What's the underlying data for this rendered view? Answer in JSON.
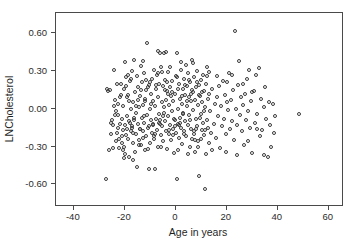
{
  "chart_data": {
    "type": "scatter",
    "title": "",
    "xlabel": "Age in years",
    "ylabel": "LNCholesterol",
    "xlim": [
      -47,
      66
    ],
    "ylim": [
      -0.78,
      0.76
    ],
    "grid": false,
    "legend": null,
    "xticks": [
      -40,
      -20,
      0,
      20,
      40,
      60
    ],
    "xticklabels": [
      "-40",
      "-20",
      "0",
      "20",
      "40",
      "60"
    ],
    "yticks": [
      0.6,
      0.3,
      0.0,
      -0.3,
      -0.6
    ],
    "yticklabels": [
      "0.60",
      "0.30",
      "0.00",
      "-0.30",
      "-0.60"
    ],
    "marker": "open-circle",
    "marker_color": "#3a3a3a",
    "marker_size": 4,
    "n_points": 372,
    "points": [
      [
        -27.4,
        -0.56
      ],
      [
        -26.8,
        0.16
      ],
      [
        -26.2,
        -0.33
      ],
      [
        -25.9,
        0.15
      ],
      [
        -25.4,
        -0.2
      ],
      [
        -25.0,
        -0.09
      ],
      [
        -24.6,
        -0.13
      ],
      [
        -24.2,
        0.31
      ],
      [
        -24.0,
        -0.05
      ],
      [
        -23.6,
        -0.26
      ],
      [
        -23.3,
        -0.02
      ],
      [
        -23.0,
        -0.19
      ],
      [
        -22.8,
        0.04
      ],
      [
        -22.5,
        -0.15
      ],
      [
        -22.3,
        -0.31
      ],
      [
        -22.0,
        0.09
      ],
      [
        -21.8,
        -0.12
      ],
      [
        -21.6,
        0.2
      ],
      [
        -21.3,
        -0.22
      ],
      [
        -21.1,
        -0.08
      ],
      [
        -20.9,
        -0.17
      ],
      [
        -20.7,
        0.02
      ],
      [
        -20.5,
        -0.3
      ],
      [
        -20.3,
        -0.39
      ],
      [
        -20.1,
        0.37
      ],
      [
        -19.9,
        -0.13
      ],
      [
        -19.7,
        0.25
      ],
      [
        -19.5,
        -0.21
      ],
      [
        -19.3,
        -0.06
      ],
      [
        -19.1,
        -0.16
      ],
      [
        -18.9,
        0.11
      ],
      [
        -18.7,
        -0.24
      ],
      [
        -18.5,
        0.06
      ],
      [
        -18.3,
        -0.38
      ],
      [
        -18.1,
        -0.11
      ],
      [
        -17.9,
        0.22
      ],
      [
        -17.7,
        -0.18
      ],
      [
        -17.5,
        0.0
      ],
      [
        -17.3,
        -0.14
      ],
      [
        -17.1,
        0.3
      ],
      [
        -16.9,
        -0.27
      ],
      [
        -16.7,
        0.05
      ],
      [
        -16.5,
        -0.09
      ],
      [
        -16.3,
        0.39
      ],
      [
        -16.1,
        -0.34
      ],
      [
        -15.9,
        0.13
      ],
      [
        -15.7,
        -0.2
      ],
      [
        -15.5,
        -0.03
      ],
      [
        -15.3,
        0.26
      ],
      [
        -15.1,
        -0.46
      ],
      [
        -14.9,
        -0.12
      ],
      [
        -14.7,
        0.17
      ],
      [
        -14.5,
        -0.25
      ],
      [
        -14.3,
        0.01
      ],
      [
        -14.1,
        -0.16
      ],
      [
        -13.9,
        0.1
      ],
      [
        -13.7,
        -0.29
      ],
      [
        -13.5,
        0.34
      ],
      [
        -13.3,
        -0.07
      ],
      [
        -13.1,
        0.21
      ],
      [
        -12.9,
        -0.18
      ],
      [
        -12.7,
        0.03
      ],
      [
        -12.5,
        -0.11
      ],
      [
        -12.3,
        0.28
      ],
      [
        -12.1,
        -0.33
      ],
      [
        -11.9,
        0.08
      ],
      [
        -11.7,
        -0.22
      ],
      [
        -11.5,
        0.15
      ],
      [
        -11.3,
        -0.05
      ],
      [
        -11.1,
        0.52
      ],
      [
        -10.9,
        -0.15
      ],
      [
        -10.7,
        0.19
      ],
      [
        -10.5,
        -0.48
      ],
      [
        -10.3,
        0.0
      ],
      [
        -10.1,
        -0.27
      ],
      [
        -9.9,
        0.12
      ],
      [
        -9.7,
        -0.09
      ],
      [
        -9.5,
        0.24
      ],
      [
        -9.3,
        -0.19
      ],
      [
        -9.1,
        0.06
      ],
      [
        -8.9,
        -0.13
      ],
      [
        -8.7,
        0.31
      ],
      [
        -8.5,
        -0.24
      ],
      [
        -8.3,
        0.02
      ],
      [
        -8.1,
        -0.48
      ],
      [
        -7.9,
        0.16
      ],
      [
        -7.7,
        -0.08
      ],
      [
        -7.5,
        0.27
      ],
      [
        -7.3,
        -0.17
      ],
      [
        -7.1,
        0.09
      ],
      [
        -6.9,
        -0.3
      ],
      [
        -6.7,
        0.2
      ],
      [
        -6.5,
        -0.04
      ],
      [
        -6.3,
        0.44
      ],
      [
        -6.1,
        -0.12
      ],
      [
        -5.9,
        0.33
      ],
      [
        -5.7,
        -0.21
      ],
      [
        -5.5,
        0.05
      ],
      [
        -5.3,
        -0.14
      ],
      [
        -5.1,
        0.18
      ],
      [
        -4.9,
        -0.26
      ],
      [
        -4.7,
        0.44
      ],
      [
        -4.5,
        0.01
      ],
      [
        -4.3,
        -0.1
      ],
      [
        -4.1,
        0.23
      ],
      [
        -3.9,
        -0.18
      ],
      [
        -3.7,
        0.07
      ],
      [
        -3.5,
        -0.32
      ],
      [
        -3.3,
        0.14
      ],
      [
        -3.1,
        -0.06
      ],
      [
        -2.9,
        0.29
      ],
      [
        -2.7,
        -0.2
      ],
      [
        -2.5,
        0.03
      ],
      [
        -2.3,
        -0.13
      ],
      [
        -2.1,
        0.17
      ],
      [
        -1.9,
        -0.25
      ],
      [
        -1.7,
        0.1
      ],
      [
        -1.5,
        -0.02
      ],
      [
        -1.3,
        0.22
      ],
      [
        -1.1,
        -0.16
      ],
      [
        -0.9,
        0.06
      ],
      [
        -0.7,
        -0.35
      ],
      [
        -0.5,
        0.12
      ],
      [
        -0.3,
        -0.09
      ],
      [
        -0.1,
        0.26
      ],
      [
        0.1,
        -0.19
      ],
      [
        0.3,
        0.44
      ],
      [
        0.5,
        -0.56
      ],
      [
        0.7,
        0.0
      ],
      [
        0.9,
        -0.12
      ],
      [
        1.1,
        0.2
      ],
      [
        1.3,
        -0.23
      ],
      [
        1.5,
        0.08
      ],
      [
        1.7,
        -0.07
      ],
      [
        1.9,
        0.31
      ],
      [
        2.1,
        -0.15
      ],
      [
        2.3,
        0.04
      ],
      [
        2.5,
        -0.28
      ],
      [
        2.7,
        0.16
      ],
      [
        2.9,
        -0.03
      ],
      [
        3.1,
        0.24
      ],
      [
        3.3,
        -0.18
      ],
      [
        3.5,
        0.11
      ],
      [
        3.7,
        -0.1
      ],
      [
        3.9,
        0.35
      ],
      [
        4.1,
        -0.22
      ],
      [
        4.3,
        0.02
      ],
      [
        4.5,
        0.18
      ],
      [
        4.7,
        -0.13
      ],
      [
        4.9,
        0.28
      ],
      [
        5.1,
        -0.05
      ],
      [
        5.3,
        0.09
      ],
      [
        5.5,
        -0.3
      ],
      [
        5.7,
        0.21
      ],
      [
        5.9,
        -0.16
      ],
      [
        6.1,
        0.06
      ],
      [
        6.3,
        0.39
      ],
      [
        6.5,
        -0.24
      ],
      [
        6.7,
        0.13
      ],
      [
        6.9,
        -0.01
      ],
      [
        7.1,
        0.25
      ],
      [
        7.3,
        -0.2
      ],
      [
        7.5,
        0.07
      ],
      [
        7.7,
        -0.34
      ],
      [
        7.9,
        0.17
      ],
      [
        8.1,
        -0.08
      ],
      [
        8.3,
        0.3
      ],
      [
        8.5,
        -0.14
      ],
      [
        8.7,
        0.03
      ],
      [
        8.9,
        -0.26
      ],
      [
        9.1,
        0.19
      ],
      [
        9.3,
        -0.53
      ],
      [
        9.5,
        0.1
      ],
      [
        9.7,
        -0.04
      ],
      [
        9.9,
        0.23
      ],
      [
        10.1,
        -0.17
      ],
      [
        10.3,
        0.05
      ],
      [
        10.5,
        -0.11
      ],
      [
        10.7,
        0.27
      ],
      [
        10.9,
        -0.21
      ],
      [
        11.1,
        0.14
      ],
      [
        11.3,
        -0.64
      ],
      [
        11.5,
        0.01
      ],
      [
        11.7,
        -0.36
      ],
      [
        11.9,
        0.2
      ],
      [
        12.1,
        -0.09
      ],
      [
        12.3,
        0.26
      ],
      [
        12.5,
        -0.15
      ],
      [
        12.7,
        0.08
      ],
      [
        12.9,
        -0.27
      ],
      [
        13.2,
        0.12
      ],
      [
        13.6,
        -0.02
      ],
      [
        14.0,
        -0.19
      ],
      [
        14.4,
        0.16
      ],
      [
        14.8,
        -0.12
      ],
      [
        15.2,
        0.04
      ],
      [
        15.6,
        -0.23
      ],
      [
        16.0,
        0.09
      ],
      [
        16.4,
        -0.06
      ],
      [
        16.8,
        0.18
      ],
      [
        17.2,
        -0.31
      ],
      [
        17.6,
        0.02
      ],
      [
        18.0,
        -0.14
      ],
      [
        18.4,
        0.22
      ],
      [
        18.8,
        -0.08
      ],
      [
        19.2,
        0.11
      ],
      [
        19.6,
        -0.2
      ],
      [
        20.0,
        0.05
      ],
      [
        20.4,
        -0.01
      ],
      [
        20.8,
        0.28
      ],
      [
        21.2,
        -0.16
      ],
      [
        21.6,
        0.07
      ],
      [
        22.0,
        -0.1
      ],
      [
        22.4,
        0.15
      ],
      [
        22.8,
        -0.25
      ],
      [
        23.2,
        0.62
      ],
      [
        23.6,
        0.0
      ],
      [
        24.0,
        -0.13
      ],
      [
        24.4,
        0.19
      ],
      [
        24.8,
        0.38
      ],
      [
        25.2,
        -0.05
      ],
      [
        25.6,
        0.09
      ],
      [
        26.0,
        -0.18
      ],
      [
        26.4,
        0.03
      ],
      [
        26.8,
        -0.29
      ],
      [
        27.2,
        0.12
      ],
      [
        27.6,
        -0.09
      ],
      [
        28.0,
        0.24
      ],
      [
        28.4,
        -0.02
      ],
      [
        28.8,
        0.31
      ],
      [
        29.2,
        -0.15
      ],
      [
        29.6,
        0.06
      ],
      [
        30.0,
        -0.35
      ],
      [
        30.5,
        0.14
      ],
      [
        31.0,
        -0.11
      ],
      [
        31.5,
        0.27
      ],
      [
        32.0,
        -0.04
      ],
      [
        32.5,
        0.32
      ],
      [
        33.0,
        -0.22
      ],
      [
        33.5,
        0.08
      ],
      [
        34.0,
        -0.17
      ],
      [
        34.5,
        0.01
      ],
      [
        35.0,
        0.17
      ],
      [
        35.5,
        -0.08
      ],
      [
        36.0,
        -0.38
      ],
      [
        36.5,
        0.05
      ],
      [
        37.0,
        -0.13
      ],
      [
        37.5,
        -0.3
      ],
      [
        38.0,
        0.04
      ],
      [
        38.5,
        -0.19
      ],
      [
        39.0,
        -0.06
      ],
      [
        48.2,
        -0.04
      ],
      [
        -26.5,
        0.14
      ],
      [
        -24.8,
        -0.31
      ],
      [
        -23.8,
        0.07
      ],
      [
        -22.2,
        -0.24
      ],
      [
        -21.5,
        0.11
      ],
      [
        -20.6,
        -0.33
      ],
      [
        -19.4,
        0.18
      ],
      [
        -18.2,
        -0.1
      ],
      [
        -17.4,
        0.24
      ],
      [
        -16.6,
        -0.19
      ],
      [
        -15.6,
        0.02
      ],
      [
        -14.6,
        -0.29
      ],
      [
        -13.6,
        0.15
      ],
      [
        -12.6,
        -0.06
      ],
      [
        -11.6,
        0.23
      ],
      [
        -10.6,
        -0.14
      ],
      [
        -9.6,
        0.04
      ],
      [
        -8.6,
        -0.22
      ],
      [
        -7.6,
        0.19
      ],
      [
        -6.6,
        -0.11
      ],
      [
        -5.6,
        0.29
      ],
      [
        -4.6,
        -0.03
      ],
      [
        -3.6,
        0.21
      ],
      [
        -2.6,
        -0.17
      ],
      [
        -1.6,
        0.13
      ],
      [
        -0.6,
        -0.08
      ],
      [
        0.4,
        0.25
      ],
      [
        1.4,
        -0.13
      ],
      [
        2.4,
        0.1
      ],
      [
        3.4,
        -0.2
      ],
      [
        4.4,
        0.06
      ],
      [
        5.4,
        -0.09
      ],
      [
        6.4,
        0.15
      ],
      [
        7.4,
        -0.25
      ],
      [
        8.4,
        0.21
      ],
      [
        9.4,
        -0.07
      ],
      [
        10.4,
        0.13
      ],
      [
        11.4,
        -0.17
      ],
      [
        12.4,
        0.33
      ],
      [
        -25.5,
        -0.11
      ],
      [
        -23.1,
        0.2
      ],
      [
        -21.0,
        -0.27
      ],
      [
        -19.0,
        0.09
      ],
      [
        -17.0,
        -0.15
      ],
      [
        -15.0,
        0.07
      ],
      [
        -13.0,
        -0.23
      ],
      [
        -11.0,
        0.17
      ],
      [
        -9.0,
        -0.12
      ],
      [
        -7.0,
        0.28
      ],
      [
        -5.0,
        -0.06
      ],
      [
        -3.0,
        0.12
      ],
      [
        -1.0,
        -0.21
      ],
      [
        1.0,
        0.16
      ],
      [
        3.0,
        -0.04
      ],
      [
        5.0,
        0.23
      ],
      [
        7.0,
        -0.18
      ],
      [
        9.0,
        0.11
      ],
      [
        11.0,
        -0.02
      ],
      [
        13.0,
        0.29
      ],
      [
        -22.6,
        -0.05
      ],
      [
        -18.6,
        0.27
      ],
      [
        -14.2,
        -0.16
      ],
      [
        -10.2,
        0.21
      ],
      [
        -6.2,
        -0.09
      ],
      [
        -2.2,
        0.33
      ],
      [
        1.8,
        -0.11
      ],
      [
        5.8,
        0.12
      ],
      [
        9.8,
        -0.24
      ],
      [
        -20.2,
        0.16
      ],
      [
        -16.2,
        -0.07
      ],
      [
        -12.2,
        0.06
      ],
      [
        -8.2,
        -0.2
      ],
      [
        -4.2,
        0.15
      ],
      [
        -0.2,
        -0.14
      ],
      [
        3.8,
        0.19
      ],
      [
        7.8,
        -0.16
      ],
      [
        -24.4,
        0.02
      ],
      [
        -12.8,
        0.38
      ],
      [
        -6.8,
        0.46
      ],
      [
        -3.8,
        0.45
      ],
      [
        2.2,
        0.37
      ],
      [
        6.8,
        0.36
      ],
      [
        -19.8,
        -0.36
      ],
      [
        -16.8,
        -0.41
      ],
      [
        -10.8,
        -0.32
      ],
      [
        -5.8,
        -0.3
      ],
      [
        0.8,
        -0.33
      ],
      [
        4.8,
        -0.36
      ],
      [
        8.8,
        -0.3
      ],
      [
        14.2,
        -0.33
      ],
      [
        19.8,
        -0.34
      ],
      [
        24.2,
        -0.37
      ],
      [
        28.2,
        -0.26
      ],
      [
        31.8,
        -0.16
      ],
      [
        34.8,
        -0.37
      ],
      [
        26.2,
        0.2
      ],
      [
        29.8,
        0.13
      ],
      [
        22.2,
        0.27
      ],
      [
        20.2,
        0.21
      ],
      [
        16.2,
        0.26
      ]
    ]
  }
}
